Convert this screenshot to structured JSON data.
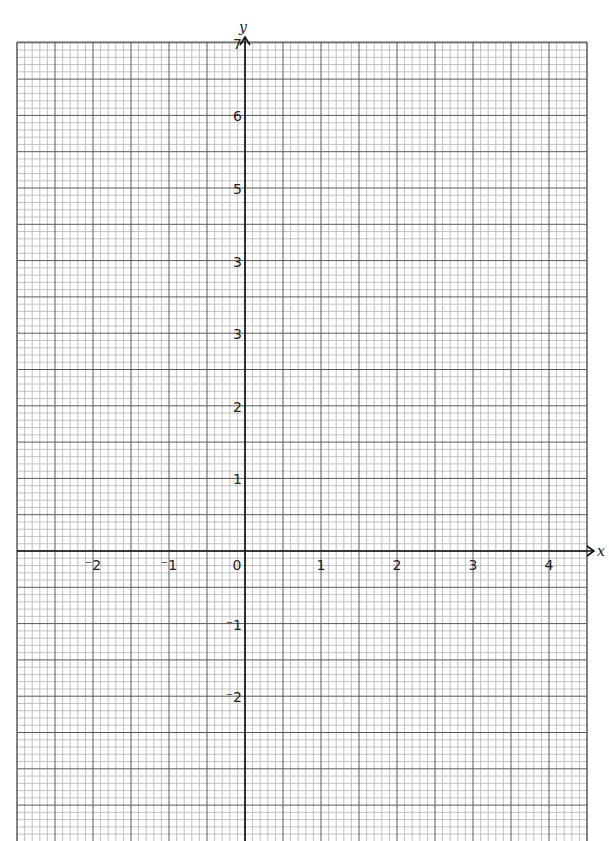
{
  "chart_data": {
    "type": "scatter",
    "title": "",
    "xlabel": "x",
    "ylabel": "y",
    "xlim": [
      -3,
      4.5
    ],
    "ylim": [
      -4,
      7
    ],
    "grid": true,
    "minor_divisions_per_unit": 10,
    "x_tick_labels": [
      {
        "value": -2,
        "label": "⁻2"
      },
      {
        "value": -1,
        "label": "⁻1"
      },
      {
        "value": 0,
        "label": "0"
      },
      {
        "value": 1,
        "label": "1"
      },
      {
        "value": 2,
        "label": "2"
      },
      {
        "value": 3,
        "label": "3"
      },
      {
        "value": 4,
        "label": "4"
      }
    ],
    "y_tick_labels": [
      {
        "value": 7,
        "label": "7"
      },
      {
        "value": 6,
        "label": "6"
      },
      {
        "value": 5,
        "label": "5"
      },
      {
        "value": 4,
        "label": "3"
      },
      {
        "value": 3,
        "label": "3"
      },
      {
        "value": 2,
        "label": "2"
      },
      {
        "value": 1,
        "label": "1"
      },
      {
        "value": -1,
        "label": "⁻1"
      },
      {
        "value": -2,
        "label": "⁻2"
      }
    ],
    "series": []
  },
  "layout": {
    "origin_px": [
      245,
      551
    ],
    "unit_x_px": 76,
    "unit_y_px": 72.6,
    "grid_left_px": 17,
    "grid_right_px": 587,
    "grid_top_px": 42,
    "grid_bottom_px": 841,
    "colors": {
      "minor": "#b4b4b4",
      "major": "#5a5a5a",
      "axis": "#111111"
    }
  }
}
